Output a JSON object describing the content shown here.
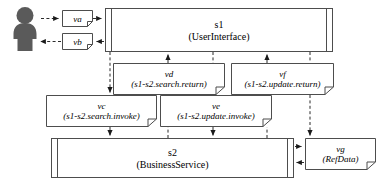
{
  "diagram": {
    "actor": {
      "name": "user-actor",
      "label": ""
    },
    "components": [
      {
        "id": "s1",
        "name": "s1",
        "stereotype": "(UserInterface)",
        "x": 105,
        "y": 8,
        "w": 228,
        "h": 44
      },
      {
        "id": "s2",
        "name": "s2",
        "stereotype": "(BusinessService)",
        "x": 51,
        "y": 138,
        "w": 243,
        "h": 40
      }
    ],
    "notes": [
      {
        "id": "va",
        "label": "va",
        "detail": "",
        "x": 62,
        "y": 10,
        "w": 31,
        "h": 17
      },
      {
        "id": "vb",
        "label": "vb",
        "detail": "",
        "x": 62,
        "y": 33,
        "w": 31,
        "h": 17
      },
      {
        "id": "vd",
        "label": "vd",
        "detail": "(s1-s2.search.return)",
        "x": 113,
        "y": 63,
        "w": 112,
        "h": 32
      },
      {
        "id": "vf",
        "label": "vf",
        "detail": "(s1-s2.update.return)",
        "x": 231,
        "y": 63,
        "w": 103,
        "h": 32
      },
      {
        "id": "vc",
        "label": "vc",
        "detail": "(s1-s2.search.invoke)",
        "x": 46,
        "y": 95,
        "w": 111,
        "h": 32
      },
      {
        "id": "ve",
        "label": "ve",
        "detail": "(s1-s2.update.invoke)",
        "x": 160,
        "y": 95,
        "w": 112,
        "h": 32
      },
      {
        "id": "vg",
        "label": "vg",
        "detail": "(RefData)",
        "x": 305,
        "y": 138,
        "w": 71,
        "h": 32
      }
    ],
    "flows": [
      {
        "id": "actor-to-va",
        "from": "actor",
        "to": "va",
        "style": "dashed",
        "direction": "right"
      },
      {
        "id": "va-to-s1",
        "from": "va",
        "to": "s1",
        "style": "dashed",
        "direction": "right"
      },
      {
        "id": "s1-to-vb",
        "from": "s1",
        "to": "vb",
        "style": "dashed",
        "direction": "left"
      },
      {
        "id": "vb-to-actor",
        "from": "vb",
        "to": "actor",
        "style": "dashed",
        "direction": "left"
      },
      {
        "id": "s1-to-vc",
        "from": "s1",
        "to": "vc",
        "style": "dashed",
        "direction": "down"
      },
      {
        "id": "vc-to-s2",
        "from": "vc",
        "to": "s2",
        "style": "dashed",
        "direction": "down"
      },
      {
        "id": "s2-to-vd",
        "from": "s2",
        "to": "vd",
        "style": "dashed",
        "direction": "up"
      },
      {
        "id": "vd-to-s1",
        "from": "vd",
        "to": "s1",
        "style": "dashed",
        "direction": "up"
      },
      {
        "id": "s1-to-ve",
        "from": "s1",
        "to": "ve",
        "style": "dashed",
        "direction": "down"
      },
      {
        "id": "ve-to-s2",
        "from": "ve",
        "to": "s2",
        "style": "dashed",
        "direction": "down"
      },
      {
        "id": "s2-to-vf",
        "from": "s2",
        "to": "vf",
        "style": "dashed",
        "direction": "up"
      },
      {
        "id": "vf-to-s1",
        "from": "vf",
        "to": "s1",
        "style": "dashed",
        "direction": "up"
      },
      {
        "id": "s2-to-vg",
        "from": "s2",
        "to": "vg",
        "style": "dashed",
        "direction": "right"
      },
      {
        "id": "vg-to-s2",
        "from": "vg",
        "to": "s2",
        "style": "dashed",
        "direction": "left"
      }
    ],
    "colors": {
      "line": "#4d4d4d",
      "actor_fill": "#5a5a5a",
      "background": "#ffffff",
      "text": "#000000"
    }
  }
}
